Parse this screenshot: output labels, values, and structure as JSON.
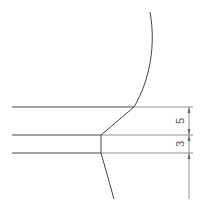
{
  "drawing": {
    "colors": {
      "line": "#444444",
      "dimension": "#666666",
      "background": "#ffffff"
    },
    "dimensions": [
      {
        "label": "5",
        "from_y": 107,
        "to_y": 135
      },
      {
        "label": "3",
        "from_y": 135,
        "to_y": 153
      }
    ],
    "horizontal_lines_y": [
      107,
      135,
      153
    ]
  }
}
